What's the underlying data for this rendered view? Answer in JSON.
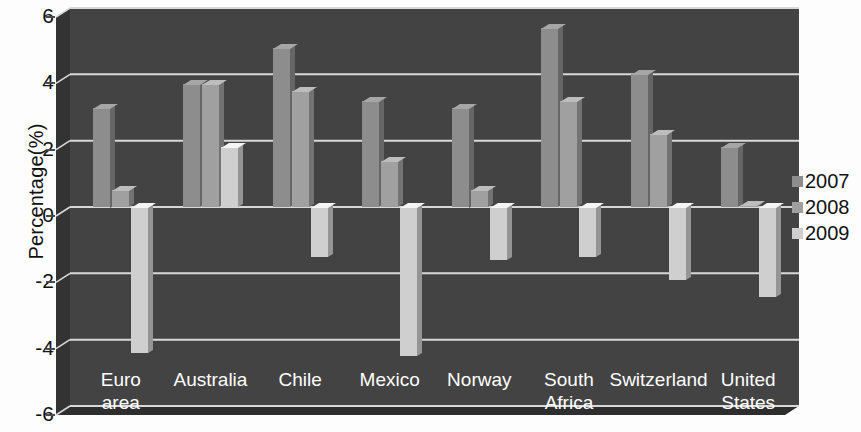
{
  "chart_data": {
    "type": "bar",
    "title": "",
    "xlabel": "",
    "ylabel": "Percentage(%)",
    "ylim": [
      -6,
      6
    ],
    "yticks": [
      6,
      4,
      2,
      0,
      -2,
      -4,
      -6
    ],
    "ytick_labels": [
      "6",
      "4",
      "2",
      "0",
      "-2",
      "-4",
      "-6"
    ],
    "grid": true,
    "legend_position": "right",
    "style": "3d-grouped-bars",
    "categories": [
      "Euro\narea",
      "Australia",
      "Chile",
      "Mexico",
      "Norway",
      "South\nAfrica",
      "Switzerland",
      "United\nStates"
    ],
    "series": [
      {
        "name": "2007",
        "color": "#8d8d8d",
        "values": [
          3.0,
          3.7,
          4.8,
          3.2,
          3.0,
          5.4,
          4.0,
          1.8
        ]
      },
      {
        "name": "2008",
        "color": "#a0a0a0",
        "values": [
          0.5,
          3.7,
          3.5,
          1.4,
          0.5,
          3.2,
          2.2,
          0.05
        ]
      },
      {
        "name": "2009",
        "color": "#cfcfcf",
        "values": [
          -4.4,
          1.8,
          -1.5,
          -4.5,
          -1.6,
          -1.5,
          -2.2,
          -2.7
        ]
      }
    ]
  },
  "colors": {
    "plot_background": "#434343",
    "back_wall": "#3d3d3d",
    "floor": "#2e2e2e",
    "left_wall": "#333333",
    "gridline": "#d8d8d8",
    "axis_text": "#111111",
    "category_text": "#ffffff"
  },
  "legend": {
    "items": [
      {
        "label": "2007",
        "color": "#8d8d8d"
      },
      {
        "label": "2008",
        "color": "#a0a0a0"
      },
      {
        "label": "2009",
        "color": "#cfcfcf"
      }
    ]
  }
}
